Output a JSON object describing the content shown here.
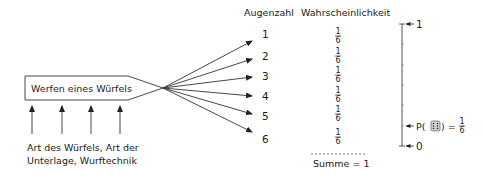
{
  "process_box": {
    "label": "Werfen eines Würfels"
  },
  "influences": {
    "line1": "Art des Würfels, Art der",
    "line2": "Unterlage, Wurftechnik",
    "arrow_count": 4
  },
  "headers": {
    "outcome": "Augenzahl",
    "probability": "Wahrscheinlichkeit"
  },
  "outcomes": [
    {
      "value": "1",
      "num": "1",
      "den": "6"
    },
    {
      "value": "2",
      "num": "1",
      "den": "6"
    },
    {
      "value": "3",
      "num": "1",
      "den": "6"
    },
    {
      "value": "4",
      "num": "1",
      "den": "6"
    },
    {
      "value": "5",
      "num": "1",
      "den": "6"
    },
    {
      "value": "6",
      "num": "1",
      "den": "6"
    }
  ],
  "sum": {
    "label": "Summe = 1"
  },
  "scale": {
    "top_label": "1",
    "bottom_label": "0",
    "marker_prefix": "P(",
    "marker_suffix": ") =",
    "marker_num": "1",
    "marker_den": "6",
    "marker_icon": "die-six-icon"
  },
  "colors": {
    "line": "#333333",
    "text": "#1a1a1a",
    "background": "#ffffff"
  }
}
